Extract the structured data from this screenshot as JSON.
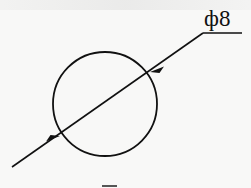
{
  "diagram": {
    "type": "diameter-dimension",
    "dimension_label": "ф8",
    "colors": {
      "stroke": "#111111",
      "background": "#f8f8f7"
    },
    "circle": {
      "cx": 105,
      "cy": 104,
      "r": 52
    },
    "leader": {
      "start": [
        12,
        167
      ],
      "knee": [
        203,
        33
      ],
      "end": [
        242,
        33
      ]
    },
    "arrows": [
      {
        "at": [
          59,
          136
        ],
        "direction": "up-right"
      },
      {
        "at": [
          151,
          71
        ],
        "direction": "down-left"
      }
    ]
  }
}
